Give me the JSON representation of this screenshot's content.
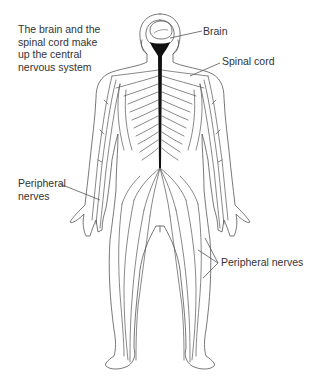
{
  "diagram": {
    "caption": {
      "lines": [
        "The brain and the",
        "spinal cord make",
        "up the central",
        "nervous system"
      ]
    },
    "labels": {
      "brain": "Brain",
      "spinal_cord": "Spinal cord",
      "peripheral_left": [
        "Peripheral",
        "nerves"
      ],
      "peripheral_right": "Peripheral nerves"
    },
    "colors": {
      "outline": "#555555",
      "spinal_cord": "#111111",
      "text": "#333333",
      "background": "#ffffff"
    }
  }
}
